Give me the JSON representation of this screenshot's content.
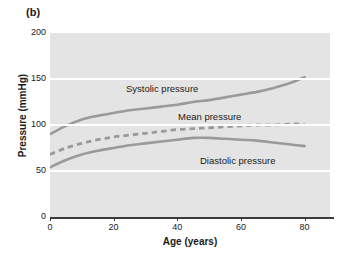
{
  "figure": {
    "panel_tag": "(b)"
  },
  "chart_data": {
    "type": "line",
    "title": "",
    "xlabel": "Age (years)",
    "ylabel": "Pressure (mmHg)",
    "xlim": [
      0,
      88
    ],
    "ylim": [
      0,
      200
    ],
    "xticks": [
      0,
      20,
      40,
      60,
      80
    ],
    "xtick_labels": [
      "0",
      "20",
      "40",
      "60",
      "80"
    ],
    "yticks": [
      0,
      50,
      100,
      150,
      200
    ],
    "ytick_labels": [
      "0",
      "50",
      "100",
      "150",
      "200"
    ],
    "grid": "horizontal-white-at-50-100-150",
    "legend_position": "inline-annotations",
    "plot_background": "#e4e4e4",
    "line_color": "#9a9a9a",
    "axis_color": "#3a3a3a",
    "x": [
      0,
      5,
      10,
      15,
      20,
      25,
      30,
      35,
      40,
      45,
      50,
      55,
      60,
      65,
      70,
      75,
      80
    ],
    "series": [
      {
        "name": "Systolic pressure",
        "style": "solid",
        "annotation": "Systolic pressure",
        "values": [
          90,
          99,
          106,
          110,
          113,
          116,
          118,
          120,
          122,
          125,
          127,
          130,
          133,
          136,
          140,
          145,
          152
        ]
      },
      {
        "name": "Mean pressure",
        "style": "dashed",
        "annotation": "Mean pressure",
        "values": [
          68,
          75,
          80,
          84,
          87,
          89,
          91,
          93,
          95,
          96,
          97,
          98,
          99,
          100,
          100,
          101,
          101
        ]
      },
      {
        "name": "Diastolic pressure",
        "style": "solid",
        "annotation": "Diastolic pressure",
        "values": [
          54,
          62,
          68,
          72,
          75,
          78,
          80,
          82,
          84,
          86,
          86,
          85,
          84,
          83,
          81,
          79,
          77
        ]
      }
    ]
  }
}
